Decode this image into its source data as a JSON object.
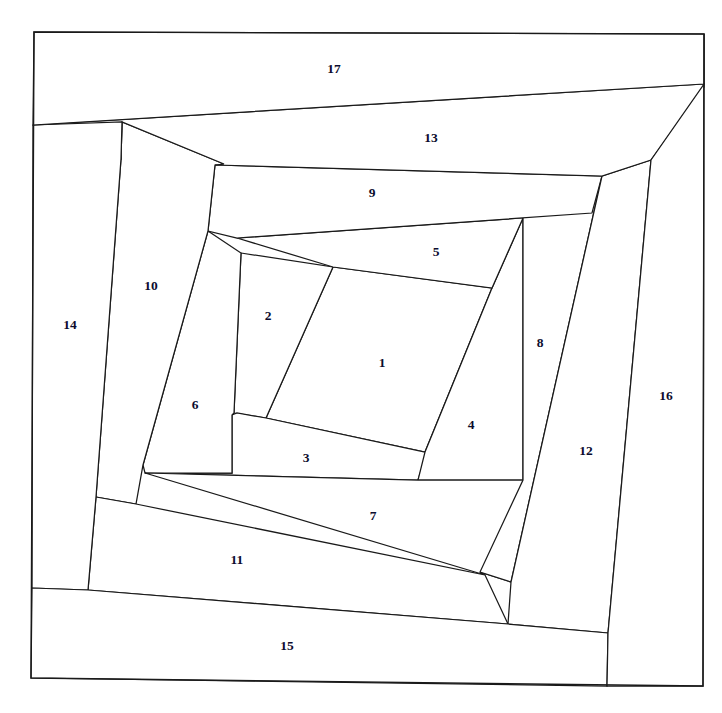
{
  "figure": {
    "background_color": "#ffffff",
    "stroke_color": "#1a1a1a",
    "label_color": "#0c0c2e",
    "width": 722,
    "height": 713
  },
  "chart_data": {
    "type": "diagram",
    "subtype": "polygon-partition",
    "title": "",
    "xlabel": "",
    "ylabel": "",
    "grid": false,
    "legend": "none",
    "region_count": 17,
    "labels": [
      "1",
      "2",
      "3",
      "4",
      "5",
      "6",
      "7",
      "8",
      "9",
      "10",
      "11",
      "12",
      "13",
      "14",
      "15",
      "16",
      "17"
    ],
    "outer_frame": [
      [
        34,
        32
      ],
      [
        704,
        34
      ],
      [
        703,
        686
      ],
      [
        31,
        678
      ]
    ],
    "regions": [
      {
        "id": "1",
        "label": "1",
        "cx": 382,
        "cy": 364,
        "points": [
          [
            333,
            267
          ],
          [
            492,
            288
          ],
          [
            425,
            452
          ],
          [
            266,
            418
          ]
        ]
      },
      {
        "id": "2",
        "label": "2",
        "cx": 268,
        "cy": 317,
        "points": [
          [
            241,
            253
          ],
          [
            333,
            267
          ],
          [
            266,
            418
          ],
          [
            234,
            413
          ]
        ]
      },
      {
        "id": "3",
        "label": "3",
        "cx": 306,
        "cy": 459,
        "points": [
          [
            232,
            415
          ],
          [
            237,
            413
          ],
          [
            266,
            418
          ],
          [
            425,
            452
          ],
          [
            427,
            452
          ],
          [
            418,
            480
          ],
          [
            145,
            473
          ],
          [
            232,
            473
          ]
        ]
      },
      {
        "id": "4",
        "label": "4",
        "cx": 471,
        "cy": 426,
        "points": [
          [
            492,
            288
          ],
          [
            523,
            218
          ],
          [
            523,
            480
          ],
          [
            418,
            480
          ],
          [
            425,
            452
          ]
        ]
      },
      {
        "id": "5",
        "label": "5",
        "cx": 436,
        "cy": 253,
        "points": [
          [
            237,
            238
          ],
          [
            592,
            213
          ],
          [
            523,
            218
          ],
          [
            492,
            288
          ],
          [
            333,
            267
          ]
        ]
      },
      {
        "id": "6",
        "label": "6",
        "cx": 195,
        "cy": 406,
        "points": [
          [
            208,
            231
          ],
          [
            241,
            253
          ],
          [
            234,
            413
          ],
          [
            232,
            415
          ],
          [
            232,
            473
          ],
          [
            145,
            473
          ],
          [
            143,
            465
          ]
        ]
      },
      {
        "id": "7",
        "label": "7",
        "cx": 373,
        "cy": 517,
        "points": [
          [
            145,
            473
          ],
          [
            418,
            480
          ],
          [
            523,
            480
          ],
          [
            511,
            582
          ],
          [
            480,
            572
          ],
          [
            485,
            575
          ]
        ]
      },
      {
        "id": "8",
        "label": "8",
        "cx": 540,
        "cy": 344,
        "points": [
          [
            523,
            218
          ],
          [
            602,
            176
          ],
          [
            511,
            582
          ],
          [
            480,
            572
          ],
          [
            523,
            480
          ]
        ]
      },
      {
        "id": "9",
        "label": "9",
        "cx": 372,
        "cy": 194,
        "points": [
          [
            215,
            165
          ],
          [
            602,
            176
          ],
          [
            592,
            213
          ],
          [
            237,
            238
          ],
          [
            208,
            231
          ]
        ]
      },
      {
        "id": "10",
        "label": "10",
        "cx": 151,
        "cy": 287,
        "points": [
          [
            122,
            122
          ],
          [
            224,
            164
          ],
          [
            215,
            165
          ],
          [
            208,
            231
          ],
          [
            143,
            465
          ],
          [
            136,
            504
          ],
          [
            96,
            497
          ],
          [
            121,
            159
          ]
        ]
      },
      {
        "id": "11",
        "label": "11",
        "cx": 237,
        "cy": 561,
        "points": [
          [
            96,
            497
          ],
          [
            136,
            504
          ],
          [
            485,
            575
          ],
          [
            508,
            624
          ],
          [
            88,
            590
          ]
        ]
      },
      {
        "id": "12",
        "label": "12",
        "cx": 586,
        "cy": 452,
        "points": [
          [
            602,
            176
          ],
          [
            651,
            160
          ],
          [
            608,
            633
          ],
          [
            508,
            624
          ],
          [
            511,
            582
          ]
        ]
      },
      {
        "id": "13",
        "label": "13",
        "cx": 431,
        "cy": 139,
        "points": [
          [
            33,
            125
          ],
          [
            704,
            84
          ],
          [
            704,
            87
          ],
          [
            651,
            160
          ],
          [
            602,
            176
          ],
          [
            215,
            165
          ],
          [
            224,
            164
          ],
          [
            122,
            122
          ],
          [
            121,
            159
          ]
        ]
      },
      {
        "id": "14",
        "label": "14",
        "cx": 70,
        "cy": 326,
        "points": [
          [
            33,
            125
          ],
          [
            122,
            122
          ],
          [
            121,
            159
          ],
          [
            96,
            497
          ],
          [
            88,
            590
          ],
          [
            32,
            588
          ]
        ]
      },
      {
        "id": "15",
        "label": "15",
        "cx": 287,
        "cy": 647,
        "points": [
          [
            32,
            588
          ],
          [
            88,
            590
          ],
          [
            508,
            624
          ],
          [
            608,
            633
          ],
          [
            607,
            686
          ],
          [
            31,
            678
          ]
        ]
      },
      {
        "id": "16",
        "label": "16",
        "cx": 666,
        "cy": 397,
        "points": [
          [
            704,
            34
          ],
          [
            704,
            84
          ],
          [
            651,
            160
          ],
          [
            608,
            633
          ],
          [
            607,
            686
          ],
          [
            703,
            686
          ]
        ]
      },
      {
        "id": "17",
        "label": "17",
        "cx": 334,
        "cy": 70,
        "points": [
          [
            34,
            32
          ],
          [
            704,
            34
          ],
          [
            704,
            84
          ],
          [
            33,
            125
          ]
        ]
      }
    ]
  }
}
